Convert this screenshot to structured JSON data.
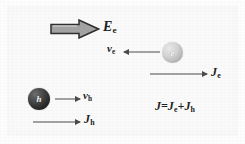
{
  "figure": {
    "background_color": "#fafafa"
  },
  "field_arrow": {
    "icon": "block-arrow-right-icon",
    "label_base": "E",
    "label_sub": "e",
    "fill_color": "#9f9f9f",
    "outline_color": "#2b2b2b",
    "direction": "right"
  },
  "electron": {
    "particle_label": "e",
    "sphere_color": "#c9c9c9",
    "velocity": {
      "label_base": "v",
      "label_sub": "e",
      "arrow_icon": "arrow-left-icon",
      "direction": "left"
    },
    "current": {
      "label_base": "J",
      "label_sub": "e",
      "arrow_icon": "arrow-right-icon",
      "direction": "right"
    }
  },
  "hole": {
    "particle_label": "h",
    "sphere_color": "#2a2a2a",
    "velocity": {
      "label_base": "v",
      "label_sub": "h",
      "arrow_icon": "arrow-right-icon",
      "direction": "right"
    },
    "current": {
      "label_base": "J",
      "label_sub": "h",
      "arrow_icon": "arrow-right-icon",
      "direction": "right"
    }
  },
  "equation": {
    "lhs": "J",
    "equals": "=",
    "term1_base": "J",
    "term1_sub": "e",
    "plus": "+",
    "term2_base": "J",
    "term2_sub": "h",
    "full_text": "J=Je+Jh"
  },
  "colors": {
    "ink": "#231f20",
    "arrow": "#4a4a4a",
    "page": "#fafafa"
  }
}
